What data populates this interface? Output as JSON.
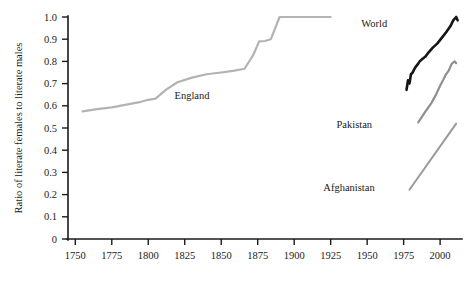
{
  "chart_data": {
    "type": "line",
    "title": "",
    "subtitle": "",
    "xlabel": "",
    "ylabel": "Ratio of literate females to literate males",
    "xlim": [
      1745,
      2015
    ],
    "ylim": [
      0,
      1.0
    ],
    "grid": false,
    "legend_position": "inline-annotations",
    "x_ticks": [
      1750,
      1775,
      1800,
      1825,
      1850,
      1875,
      1900,
      1925,
      1950,
      1975,
      2000
    ],
    "x_tick_labels": [
      "1750",
      "1775",
      "1800",
      "1825",
      "1850",
      "1875",
      "1900",
      "1925",
      "1950",
      "1975",
      "2000"
    ],
    "y_ticks": [
      0,
      0.1,
      0.2,
      0.3,
      0.4,
      0.5,
      0.6,
      0.7,
      0.8,
      0.9,
      1.0
    ],
    "y_tick_labels": [
      "0",
      "0.1",
      "0.2",
      "0.3",
      "0.4",
      "0.5",
      "0.6",
      "0.7",
      "0.8",
      "0.9",
      "1.0"
    ],
    "series": [
      {
        "name": "England",
        "color": "#b3b3b3",
        "width": 2.2,
        "label_x": 1818,
        "label_y": 0.63,
        "points": [
          [
            1755,
            0.575
          ],
          [
            1765,
            0.585
          ],
          [
            1775,
            0.593
          ],
          [
            1785,
            0.605
          ],
          [
            1795,
            0.618
          ],
          [
            1800,
            0.627
          ],
          [
            1805,
            0.632
          ],
          [
            1812,
            0.672
          ],
          [
            1820,
            0.706
          ],
          [
            1830,
            0.727
          ],
          [
            1840,
            0.742
          ],
          [
            1850,
            0.75
          ],
          [
            1858,
            0.757
          ],
          [
            1866,
            0.767
          ],
          [
            1872,
            0.83
          ],
          [
            1876,
            0.89
          ],
          [
            1880,
            0.892
          ],
          [
            1884,
            0.9
          ],
          [
            1890,
            1.0
          ],
          [
            1925,
            1.0
          ]
        ]
      },
      {
        "name": "World",
        "color": "#151515",
        "width": 2.6,
        "label_x": 1946,
        "label_y": 0.955,
        "points": [
          [
            1977,
            0.672
          ],
          [
            1978,
            0.715
          ],
          [
            1979,
            0.7
          ],
          [
            1980,
            0.742
          ],
          [
            1981,
            0.748
          ],
          [
            1983,
            0.773
          ],
          [
            1985,
            0.79
          ],
          [
            1986,
            0.8
          ],
          [
            1988,
            0.812
          ],
          [
            1990,
            0.822
          ],
          [
            1992,
            0.84
          ],
          [
            1995,
            0.862
          ],
          [
            1998,
            0.88
          ],
          [
            2001,
            0.905
          ],
          [
            2004,
            0.93
          ],
          [
            2007,
            0.958
          ],
          [
            2009,
            0.985
          ],
          [
            2011,
            1.0
          ],
          [
            2012,
            0.985
          ]
        ]
      },
      {
        "name": "Pakistan",
        "color": "#8f8f8f",
        "width": 2.2,
        "label_x": 1929,
        "label_y": 0.5,
        "points": [
          [
            1985,
            0.525
          ],
          [
            1990,
            0.575
          ],
          [
            1994,
            0.612
          ],
          [
            1997,
            0.648
          ],
          [
            2000,
            0.69
          ],
          [
            2002,
            0.715
          ],
          [
            2004,
            0.742
          ],
          [
            2006,
            0.76
          ],
          [
            2008,
            0.79
          ],
          [
            2010,
            0.8
          ],
          [
            2011,
            0.792
          ]
        ]
      },
      {
        "name": "Afghanistan",
        "color": "#9a9a9a",
        "width": 2.0,
        "label_x": 1920,
        "label_y": 0.215,
        "points": [
          [
            1979,
            0.222
          ],
          [
            2011,
            0.52
          ]
        ]
      }
    ]
  }
}
